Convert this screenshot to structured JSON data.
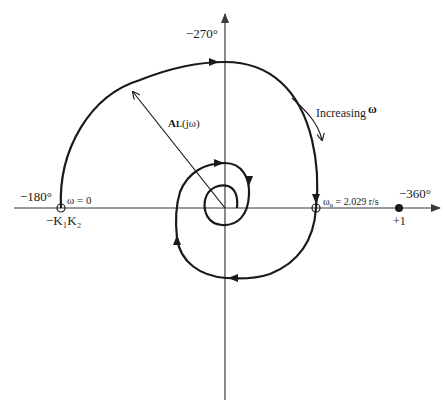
{
  "diagram": {
    "type": "nyquist-polar-plot",
    "colors": {
      "curve": "#1a1a1a",
      "axis": "#3a3a3a",
      "background": "#ffffff"
    },
    "axes": {
      "left_angle_label": "−180°",
      "top_angle_label": "−270°",
      "right_angle_label": "−360°"
    },
    "points": {
      "start_label": "ω = 0",
      "start_value_label": "−K₁K₂",
      "crossover_label": "ωu = 2.029 r/s",
      "crossover_main": "ω",
      "crossover_sub": "u",
      "crossover_value": " = 2.029 r/s",
      "critical_point_label": "+1"
    },
    "annotations": {
      "magnitude_label_main": "A",
      "magnitude_label_sub": "L",
      "magnitude_label_arg": "(jω)",
      "direction_label": "Increasing",
      "direction_symbol": "ω"
    }
  }
}
